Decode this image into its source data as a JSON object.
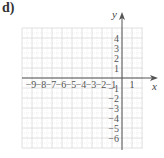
{
  "figure": {
    "label": "d)",
    "x_axis_name": "x",
    "y_axis_name": "y"
  },
  "chart_data": {
    "type": "coordinate-grid",
    "title": "d)",
    "xlabel": "x",
    "ylabel": "y",
    "x_tick_labels": [
      "-9",
      "-8",
      "-7",
      "-6",
      "-5",
      "-4",
      "-3",
      "-2",
      "-1",
      "1"
    ],
    "y_tick_labels": [
      "4",
      "3",
      "2",
      "1",
      "-1",
      "-2",
      "-3",
      "-4",
      "-5",
      "-6"
    ],
    "xlim": [
      -10,
      2
    ],
    "ylim": [
      -7,
      5
    ],
    "grid": true,
    "grid_minor": true,
    "colors": {
      "grid": "#d8d8d8",
      "grid_minor": "#ececec",
      "axis": "#555555",
      "text": "#555555"
    }
  }
}
